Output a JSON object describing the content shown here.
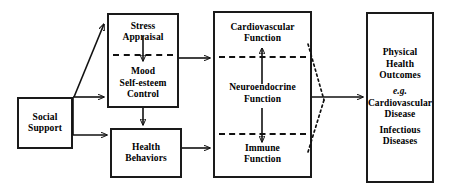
{
  "diagram": {
    "type": "flow-diagram",
    "background_color": "#ffffff",
    "line_color": "#111111",
    "nodes": [
      {
        "id": "social_support",
        "name": "social-support",
        "lines": [
          "Social",
          "Support"
        ]
      },
      {
        "id": "stress_mood",
        "name": "stress-appraisal-mood",
        "top_lines": [
          "Stress",
          "Appraisal"
        ],
        "bottom_lines": [
          "Mood",
          "Self-esteem",
          "Control"
        ],
        "internal_divider": "dashed",
        "internal_arrow": "down"
      },
      {
        "id": "health_behaviors",
        "name": "health-behaviors",
        "lines": [
          "Health",
          "Behaviors"
        ]
      },
      {
        "id": "physiological",
        "name": "physiological-function",
        "top_lines": [
          "Cardiovascular",
          "Function"
        ],
        "mid_lines": [
          "Neuroendocrine",
          "Function"
        ],
        "bottom_lines": [
          "Immune",
          "Function"
        ],
        "internal_dividers": "dashed",
        "internal_arrow_up": "Neuroendocrine to Cardiovascular",
        "internal_arrow_down": "Neuroendocrine to Immune"
      },
      {
        "id": "outcomes",
        "name": "physical-health-outcomes",
        "heading_lines": [
          "Physical",
          "Health",
          "Outcomes"
        ],
        "example_label": "e.g.",
        "example_lines": [
          "Cardiovascular",
          "Disease"
        ],
        "secondary_lines": [
          "Infectious",
          "Diseases"
        ]
      }
    ],
    "edges": [
      {
        "name": "social-support-to-stress-appraisal",
        "from": "social_support",
        "to": "stress_mood",
        "style": "solid",
        "arrow": true
      },
      {
        "name": "social-support-to-mood",
        "from": "social_support",
        "to": "stress_mood",
        "style": "solid",
        "arrow": true
      },
      {
        "name": "social-support-to-health-behaviors",
        "from": "social_support",
        "to": "health_behaviors",
        "style": "solid",
        "arrow": true
      },
      {
        "name": "mood-to-health-behaviors",
        "from": "stress_mood",
        "to": "health_behaviors",
        "style": "solid",
        "arrow": true
      },
      {
        "name": "stress-mood-to-physiological",
        "from": "stress_mood",
        "to": "physiological",
        "style": "solid",
        "arrow": true
      },
      {
        "name": "health-behaviors-to-physiological",
        "from": "health_behaviors",
        "to": "physiological",
        "style": "solid",
        "arrow": true
      },
      {
        "name": "physiological-to-outcomes",
        "from": "physiological",
        "to": "outcomes",
        "style": "solid",
        "arrow": true
      },
      {
        "name": "cardiovascular-dotted-converge",
        "from": "physiological",
        "to": "outcomes",
        "style": "dotted",
        "arrow": false
      },
      {
        "name": "immune-dotted-converge",
        "from": "physiological",
        "to": "outcomes",
        "style": "dotted",
        "arrow": false
      }
    ]
  }
}
